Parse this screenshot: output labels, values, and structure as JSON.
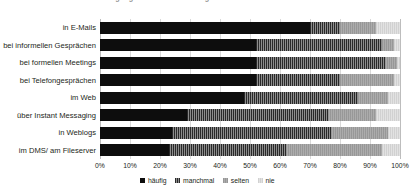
{
  "chart_data": {
    "type": "bar",
    "orientation": "horizontal",
    "stacked": true,
    "stacked_mode": "percent",
    "title": "Grad der Einbringung der technischen Möglichkeiten in die Arbeit",
    "xlabel": "",
    "ylabel": "",
    "xlim": [
      0,
      100
    ],
    "grid": true,
    "legend_position": "bottom",
    "categories": [
      "in E-Mails",
      "bei informellen Gesprächen",
      "bei formellen Meetings",
      "bei Telefongesprächen",
      "im Web",
      "über Instant Messaging",
      "in Weblogs",
      "im DMS/ am Fileserver"
    ],
    "xticks": [
      "0%",
      "10%",
      "20%",
      "30%",
      "40%",
      "50%",
      "60%",
      "70%",
      "80%",
      "90%",
      "100%"
    ],
    "series": [
      {
        "name": "häufig",
        "color": "#0d0d0d",
        "values": [
          70,
          52,
          52,
          52,
          48,
          29,
          24,
          23
        ]
      },
      {
        "name": "manchmal",
        "color": "#5b5b5b",
        "values": [
          10,
          42,
          43,
          28,
          38,
          47,
          53,
          39
        ]
      },
      {
        "name": "selten",
        "color": "#a3a3a3",
        "values": [
          12,
          4,
          4,
          18,
          10,
          16,
          19,
          32
        ]
      },
      {
        "name": "nie",
        "color": "#dcdcdc",
        "values": [
          8,
          2,
          1,
          2,
          4,
          8,
          4,
          6
        ]
      }
    ]
  }
}
